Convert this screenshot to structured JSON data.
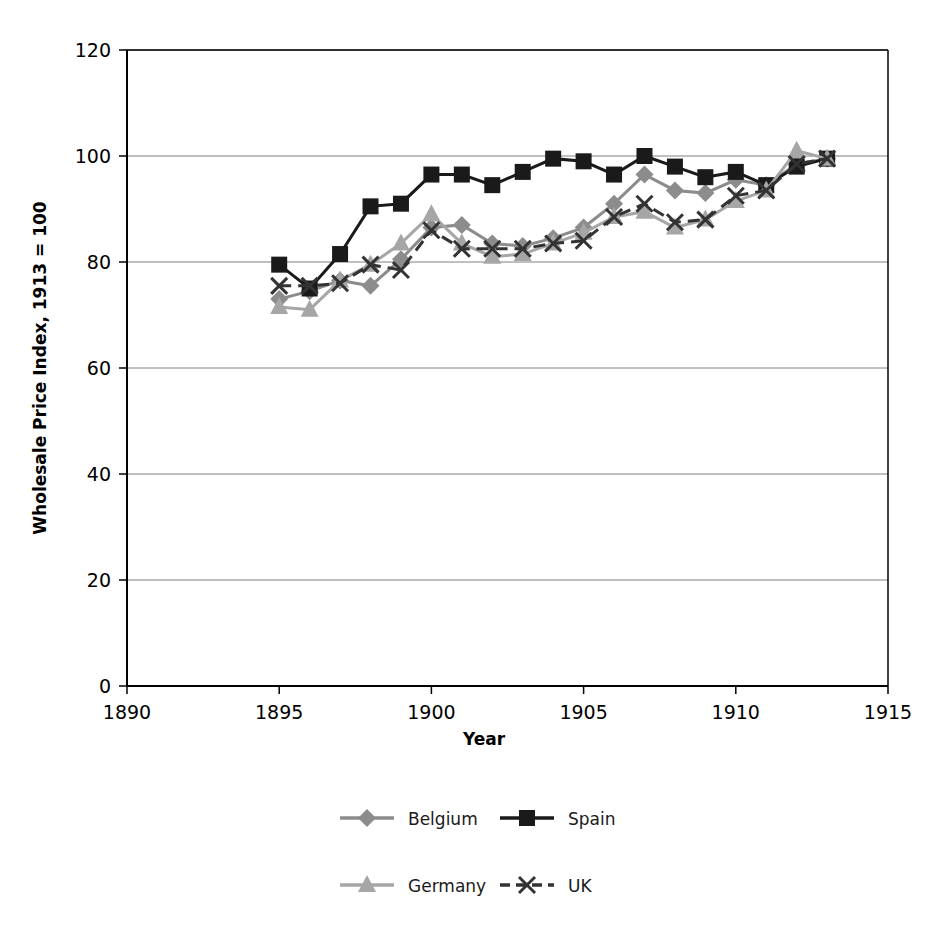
{
  "chart_data": {
    "type": "line",
    "title": "",
    "xlabel": "Year",
    "ylabel": "Wholesale Price Index, 1913 = 100",
    "xlim": [
      1890,
      1915
    ],
    "ylim": [
      0,
      120
    ],
    "xticks": [
      1890,
      1895,
      1900,
      1905,
      1910,
      1915
    ],
    "yticks": [
      0,
      20,
      40,
      60,
      80,
      100,
      120
    ],
    "grid": "horizontal",
    "legend_position": "bottom",
    "x": [
      1895,
      1896,
      1897,
      1898,
      1899,
      1900,
      1901,
      1902,
      1903,
      1904,
      1905,
      1906,
      1907,
      1908,
      1909,
      1910,
      1911,
      1912,
      1913
    ],
    "series": [
      {
        "name": "Belgium",
        "color": "#8c8c8c",
        "marker": "diamond",
        "dash": "solid",
        "values": [
          73.0,
          74.5,
          76.5,
          75.5,
          80.5,
          86.5,
          87.0,
          83.5,
          83.0,
          84.5,
          86.5,
          91.0,
          96.5,
          93.5,
          93.0,
          95.5,
          94.5,
          98.5,
          99.5
        ]
      },
      {
        "name": "Spain",
        "color": "#1a1a1a",
        "marker": "square",
        "dash": "solid",
        "values": [
          79.5,
          75.0,
          81.5,
          90.5,
          91.0,
          96.5,
          96.5,
          94.5,
          97.0,
          99.5,
          99.0,
          96.5,
          100.0,
          98.0,
          96.0,
          97.0,
          94.5,
          98.0,
          99.5
        ]
      },
      {
        "name": "Germany",
        "color": "#a6a6a6",
        "marker": "triangle",
        "dash": "solid",
        "values": [
          71.5,
          71.0,
          76.5,
          79.5,
          83.5,
          89.0,
          83.5,
          81.0,
          81.5,
          83.5,
          85.5,
          88.5,
          89.5,
          86.5,
          88.0,
          91.5,
          93.5,
          101.0,
          99.5
        ]
      },
      {
        "name": "UK",
        "color": "#333333",
        "marker": "x",
        "dash": "dashed",
        "values": [
          75.5,
          75.5,
          76.0,
          79.5,
          78.5,
          86.0,
          82.5,
          82.5,
          82.5,
          83.5,
          84.0,
          88.5,
          91.0,
          87.5,
          88.0,
          92.5,
          93.5,
          98.5,
          99.5
        ]
      }
    ]
  },
  "axes": {
    "y_title": "Wholesale Price Index, 1913 = 100",
    "x_title": "Year",
    "y_tick_labels": [
      "0",
      "20",
      "40",
      "60",
      "80",
      "100",
      "120"
    ],
    "x_tick_labels": [
      "1890",
      "1895",
      "1900",
      "1905",
      "1910",
      "1915"
    ]
  },
  "legend": {
    "entries": [
      {
        "label": "Belgium",
        "marker": "diamond-icon",
        "color": "#8c8c8c"
      },
      {
        "label": "Spain",
        "marker": "square-icon",
        "color": "#1a1a1a"
      },
      {
        "label": "Germany",
        "marker": "triangle-icon",
        "color": "#a6a6a6"
      },
      {
        "label": "UK",
        "marker": "x-icon",
        "color": "#333333"
      }
    ]
  }
}
